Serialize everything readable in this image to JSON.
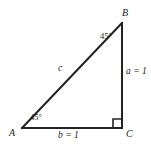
{
  "figure": {
    "kind": "geometry-diagram",
    "background_color": "#ffffff",
    "stroke_color": "#232323",
    "text_color": "#1a1a1a",
    "stroke_width": 2,
    "width": 151,
    "height": 144
  },
  "vertices": {
    "a": {
      "label": "A",
      "x": 22,
      "y": 128
    },
    "b": {
      "label": "B",
      "x": 122,
      "y": 23
    },
    "c": {
      "label": "C",
      "x": 122,
      "y": 128
    }
  },
  "sides": {
    "leg_vertical": {
      "label": "a = 1",
      "name": "a",
      "value": "1"
    },
    "leg_horizontal": {
      "label": "b = 1",
      "name": "b",
      "value": "1"
    },
    "hypotenuse": {
      "label": "c",
      "name": "c",
      "value": ""
    }
  },
  "angles": {
    "at_a": {
      "value": "45",
      "unit": "°",
      "label": "45°"
    },
    "at_b": {
      "value": "45",
      "unit": "°",
      "label": "45°"
    },
    "at_c": {
      "value": "90",
      "unit": "°",
      "label": "",
      "marker": "right-angle-square"
    }
  }
}
